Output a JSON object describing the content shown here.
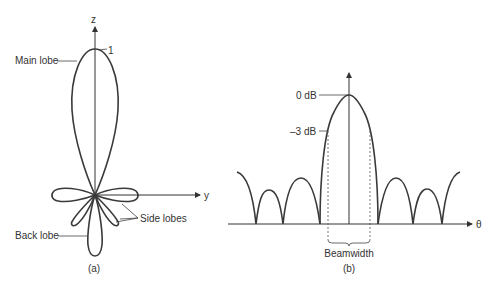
{
  "figure_a": {
    "caption": "(a)",
    "z_axis_label": "z",
    "y_axis_label": "y",
    "peak_value_label": "1",
    "main_lobe_label": "Main lobe",
    "side_lobes_label": "Side lobes",
    "back_lobe_label": "Back lobe"
  },
  "figure_b": {
    "caption": "(b)",
    "x_axis_label": "θ",
    "level_0db_label": "0 dB",
    "level_minus3db_label": "–3 dB",
    "beamwidth_label": "Beamwidth"
  },
  "colors": {
    "line": "#3a3a3a",
    "text": "#333333",
    "background": "#ffffff"
  }
}
